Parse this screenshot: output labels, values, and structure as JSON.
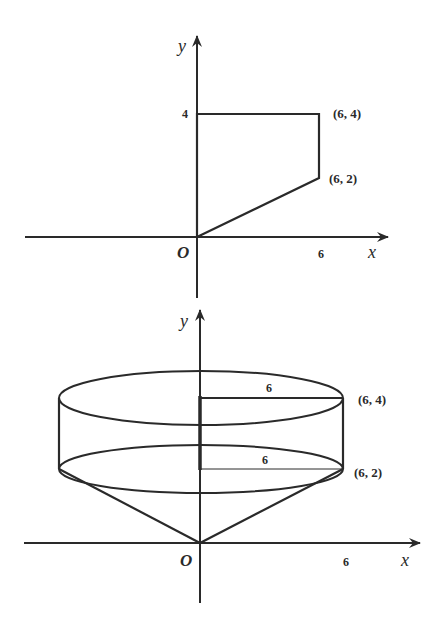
{
  "figures": [
    {
      "name": "region-2d",
      "description": "Plane region bounded by y-axis, y=4, x=6, and line from origin to (6,2)",
      "axes": {
        "x_label": "x",
        "y_label": "y",
        "origin_label": "O"
      },
      "ticks": {
        "x": "6",
        "y": "4"
      },
      "points": [
        {
          "label": "(6, 4)",
          "x": 6,
          "y": 4
        },
        {
          "label": "(6, 2)",
          "x": 6,
          "y": 2
        }
      ],
      "polygon": [
        [
          0,
          0
        ],
        [
          0,
          4
        ],
        [
          6,
          4
        ],
        [
          6,
          2
        ],
        [
          0,
          0
        ]
      ]
    },
    {
      "name": "solid-of-revolution",
      "description": "Region revolved about the y-axis: cylinder of radius 6 from y=2 to y=4 atop a cone with apex at origin",
      "axes": {
        "x_label": "x",
        "y_label": "y",
        "origin_label": "O"
      },
      "ticks": {
        "x": "6"
      },
      "radius_labels": [
        "6",
        "6"
      ],
      "points": [
        {
          "label": "(6, 4)",
          "x": 6,
          "y": 4
        },
        {
          "label": "(6, 2)",
          "x": 6,
          "y": 2
        }
      ]
    }
  ],
  "colors": {
    "stroke": "#2a2a2a",
    "background": "#ffffff"
  }
}
